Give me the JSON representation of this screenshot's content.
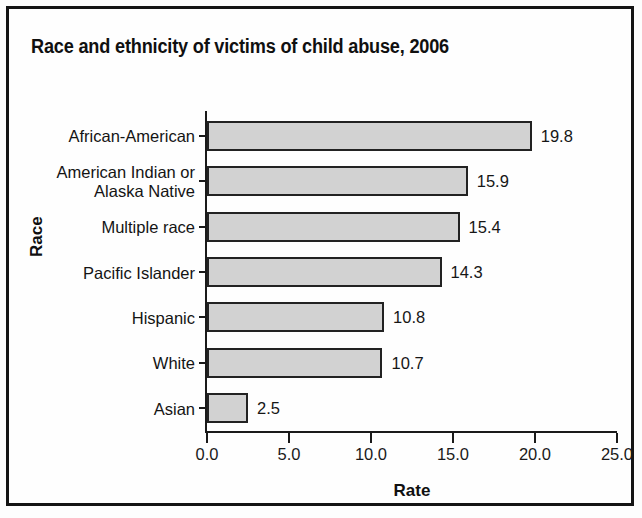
{
  "frame": {
    "border_color": "#141414",
    "background": "#fefefe"
  },
  "title": "Race and ethnicity of victims of child abuse, 2006",
  "axis_titles": {
    "x": "Rate",
    "y": "Race"
  },
  "chart_data": {
    "type": "bar",
    "orientation": "horizontal",
    "title": "Race and ethnicity of victims of child abuse, 2006",
    "xlabel": "Rate",
    "ylabel": "Race",
    "categories": [
      "African-American",
      "American Indian or\nAlaska Native",
      "Multiple race",
      "Pacific Islander",
      "Hispanic",
      "White",
      "Asian"
    ],
    "values": [
      19.8,
      15.9,
      15.4,
      14.3,
      10.8,
      10.7,
      2.5
    ],
    "value_labels": [
      "19.8",
      "15.9",
      "15.4",
      "14.3",
      "10.8",
      "10.7",
      "2.5"
    ],
    "xlim": [
      0.0,
      25.0
    ],
    "xticks": [
      0.0,
      5.0,
      10.0,
      15.0,
      20.0,
      25.0
    ],
    "xtick_labels": [
      "0.0",
      "5.0",
      "10.0",
      "15.0",
      "20.0",
      "25.0"
    ],
    "grid": false,
    "legend": null,
    "bar_fill_color": "#d2d2d2",
    "bar_edge_color": "#222222"
  }
}
